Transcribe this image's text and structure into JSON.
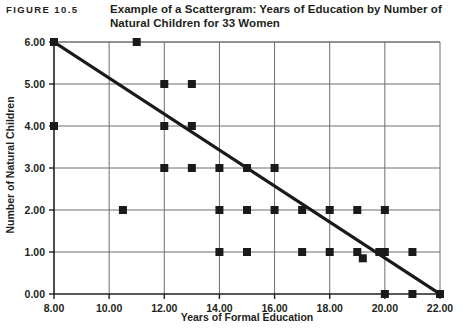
{
  "figure": {
    "number": "FIGURE 10.5",
    "caption_line1": "Example of a Scattergram: Years of Education by Number",
    "caption_line2": "of Natural Children for 33 Women"
  },
  "colors": {
    "ink": "#231f20",
    "frame": "#6d6e71",
    "grid": "#6d6e71",
    "marker": "#1a1a1a",
    "trend": "#1a1a1a",
    "background": "#ffffff"
  },
  "chart_data": {
    "type": "scatter",
    "title": "Example of a Scattergram: Years of Education by Number of Natural Children for 33 Women",
    "xlabel": "Years of Formal Education",
    "ylabel": "Number of Natural Children",
    "xlim": [
      8,
      22
    ],
    "ylim": [
      0,
      6
    ],
    "xticks": [
      8,
      10,
      12,
      14,
      16,
      18,
      20,
      22
    ],
    "xticklabels": [
      "8.00",
      "10.00",
      "12.00",
      "14.00",
      "16.00",
      "18.00",
      "20.00",
      "22.00"
    ],
    "yticks": [
      0,
      1,
      2,
      3,
      4,
      5,
      6
    ],
    "yticklabels": [
      "0.00",
      "1.00",
      "2.00",
      "3.00",
      "4.00",
      "5.00",
      "6.00"
    ],
    "grid": true,
    "grid_axis": "y-major-and-x-major",
    "legend": "none",
    "n_observations": 33,
    "marker_shape": "square",
    "points": [
      {
        "x": 8,
        "y": 6
      },
      {
        "x": 11,
        "y": 6
      },
      {
        "x": 12,
        "y": 5
      },
      {
        "x": 13,
        "y": 5
      },
      {
        "x": 8,
        "y": 4
      },
      {
        "x": 12,
        "y": 4
      },
      {
        "x": 13,
        "y": 4
      },
      {
        "x": 12,
        "y": 3
      },
      {
        "x": 13,
        "y": 3
      },
      {
        "x": 14,
        "y": 3
      },
      {
        "x": 15,
        "y": 3
      },
      {
        "x": 16,
        "y": 3
      },
      {
        "x": 10.5,
        "y": 2
      },
      {
        "x": 14,
        "y": 2
      },
      {
        "x": 15,
        "y": 2
      },
      {
        "x": 16,
        "y": 2
      },
      {
        "x": 17,
        "y": 2
      },
      {
        "x": 18,
        "y": 2
      },
      {
        "x": 19,
        "y": 2
      },
      {
        "x": 20,
        "y": 2
      },
      {
        "x": 14,
        "y": 1
      },
      {
        "x": 15,
        "y": 1
      },
      {
        "x": 17,
        "y": 1
      },
      {
        "x": 18,
        "y": 1
      },
      {
        "x": 19,
        "y": 1
      },
      {
        "x": 19.2,
        "y": 0.85
      },
      {
        "x": 19.8,
        "y": 1
      },
      {
        "x": 20,
        "y": 1
      },
      {
        "x": 21,
        "y": 1
      },
      {
        "x": 20,
        "y": 0
      },
      {
        "x": 21,
        "y": 0
      },
      {
        "x": 22,
        "y": 0
      }
    ],
    "trendline": {
      "type": "linear-fit",
      "x_start": 8,
      "y_start": 6,
      "x_end": 22,
      "y_end": 0,
      "slope": -0.4286,
      "intercept": 9.4286
    }
  }
}
